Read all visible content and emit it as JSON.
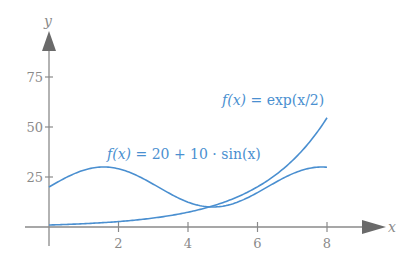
{
  "chart_data": {
    "type": "line",
    "title": "",
    "xlabel": "x",
    "ylabel": "y",
    "xlim": [
      0,
      9
    ],
    "ylim": [
      0,
      90
    ],
    "grid": false,
    "legend": "none (inline annotations)",
    "x_ticks": [
      2,
      4,
      6,
      8
    ],
    "y_ticks": [
      25,
      50,
      75
    ],
    "series": [
      {
        "name": "f(x) = exp(x/2)",
        "color": "#4a8fd0",
        "x": [
          0,
          1,
          2,
          3,
          4,
          5,
          6,
          7,
          8
        ],
        "values": [
          1.0,
          1.65,
          2.72,
          4.48,
          7.39,
          12.18,
          20.09,
          33.12,
          54.6
        ]
      },
      {
        "name": "f(x) = 20 + 10 · sin(x)",
        "color": "#4a8fd0",
        "x": [
          0,
          1,
          2,
          3,
          4,
          5,
          6,
          7,
          8
        ],
        "values": [
          20.0,
          28.41,
          29.09,
          21.41,
          12.43,
          10.41,
          17.21,
          26.57,
          29.89
        ]
      }
    ],
    "annotations": [
      {
        "text": "f(x) = exp(x/2)",
        "near_x": 6.2,
        "near_y": 60
      },
      {
        "text": "f(x) = 20 + 10 · sin(x)",
        "near_x": 2.5,
        "near_y": 35
      }
    ]
  },
  "labels": {
    "x_axis": "x",
    "y_axis": "y",
    "x_ticks": [
      "2",
      "4",
      "6",
      "8"
    ],
    "y_ticks": [
      "25",
      "50",
      "75"
    ],
    "annot_exp_fx": "f(x)",
    "annot_exp_rhs": " = exp(x/2)",
    "annot_sin_fx": "f(x)",
    "annot_sin_rhs": " = 20 + 10 · sin(x)"
  },
  "colors": {
    "curve": "#4a8fd0",
    "axis": "#8a8a8a",
    "arrow": "#6a6a6a"
  }
}
